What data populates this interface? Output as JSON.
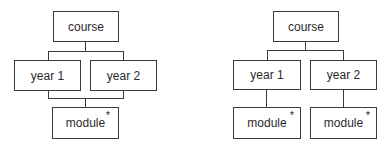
{
  "diagrams": [
    {
      "name": "left",
      "root": "course",
      "children": [
        "year 1",
        "year 2"
      ],
      "shared_child": {
        "label": "module",
        "marker": "*"
      }
    },
    {
      "name": "right",
      "root": "course",
      "children": [
        "year 1",
        "year 2"
      ],
      "child_modules": [
        {
          "label": "module",
          "marker": "*"
        },
        {
          "label": "module",
          "marker": "*"
        }
      ]
    }
  ]
}
